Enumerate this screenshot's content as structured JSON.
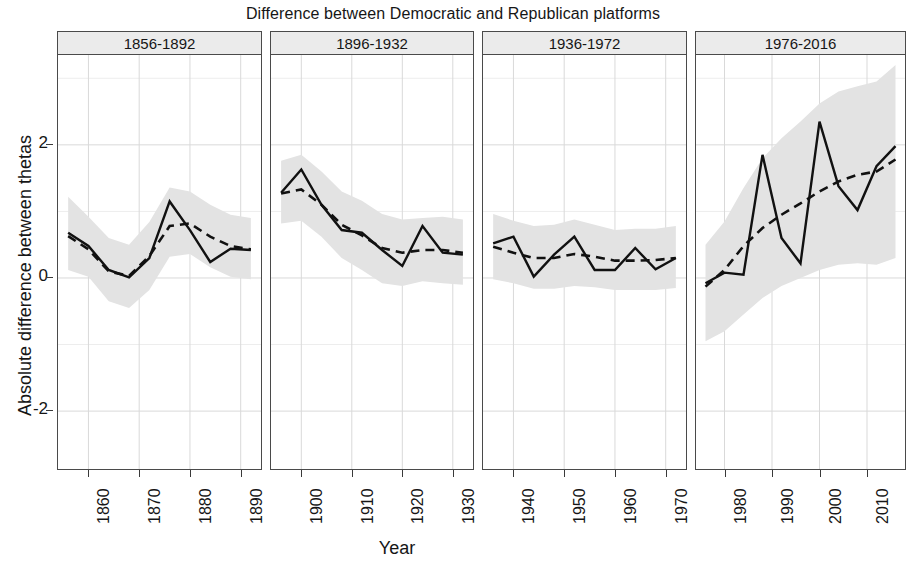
{
  "chart_data": {
    "type": "line",
    "title": "Difference between Democratic and Republican platforms",
    "xlabel": "Year",
    "ylabel": "Absolute difference between thetas",
    "ylim": [
      -2.9,
      3.35
    ],
    "yticks": [
      -2,
      0,
      2
    ],
    "ytick_labels": [
      "-2",
      "0",
      "2"
    ],
    "grid": true,
    "legend": "none",
    "facet_layout": "1x4 horizontal panels, shared y-axis, free x-axis",
    "series_names": [
      "Observed absolute difference",
      "Smoothed trend",
      "95% credible interval"
    ],
    "panels": [
      {
        "label": "1856-1892",
        "xlim": [
          1854,
          1894
        ],
        "xticks": [
          1860,
          1870,
          1880,
          1890
        ],
        "xtick_labels": [
          "1860",
          "1870",
          "1880",
          "1890"
        ],
        "x": [
          1856,
          1860,
          1864,
          1868,
          1872,
          1876,
          1880,
          1884,
          1888,
          1892
        ],
        "observed": [
          0.68,
          0.48,
          0.12,
          0.01,
          0.3,
          1.15,
          0.72,
          0.24,
          0.44,
          0.42
        ],
        "smooth": [
          0.63,
          0.43,
          0.1,
          0.03,
          0.33,
          0.78,
          0.82,
          0.62,
          0.48,
          0.43
        ],
        "ci_low": [
          0.12,
          0.02,
          -0.35,
          -0.45,
          -0.18,
          0.32,
          0.36,
          0.16,
          0.02,
          -0.02
        ],
        "ci_high": [
          1.22,
          0.92,
          0.6,
          0.5,
          0.84,
          1.36,
          1.3,
          1.1,
          0.95,
          0.9
        ]
      },
      {
        "label": "1896-1932",
        "xlim": [
          1894,
          1934
        ],
        "xticks": [
          1900,
          1910,
          1920,
          1930
        ],
        "xtick_labels": [
          "1900",
          "1910",
          "1920",
          "1930"
        ],
        "x": [
          1896,
          1900,
          1904,
          1908,
          1912,
          1916,
          1920,
          1924,
          1928,
          1932
        ],
        "observed": [
          1.28,
          1.63,
          1.1,
          0.72,
          0.68,
          0.42,
          0.18,
          0.78,
          0.38,
          0.35
        ],
        "smooth": [
          1.27,
          1.33,
          1.1,
          0.8,
          0.64,
          0.45,
          0.38,
          0.42,
          0.42,
          0.38
        ],
        "ci_low": [
          0.82,
          0.86,
          0.62,
          0.3,
          0.12,
          -0.08,
          -0.12,
          -0.05,
          -0.08,
          -0.1
        ],
        "ci_high": [
          1.76,
          1.85,
          1.6,
          1.3,
          1.16,
          0.96,
          0.88,
          0.9,
          0.92,
          0.88
        ]
      },
      {
        "label": "1936-1972",
        "xlim": [
          1934,
          1974
        ],
        "xticks": [
          1940,
          1950,
          1960,
          1970
        ],
        "xtick_labels": [
          "1940",
          "1950",
          "1960",
          "1970"
        ],
        "x": [
          1936,
          1940,
          1944,
          1948,
          1952,
          1956,
          1960,
          1964,
          1968,
          1972
        ],
        "observed": [
          0.52,
          0.62,
          0.02,
          0.35,
          0.62,
          0.12,
          0.12,
          0.45,
          0.13,
          0.3
        ],
        "smooth": [
          0.47,
          0.38,
          0.3,
          0.3,
          0.36,
          0.32,
          0.26,
          0.26,
          0.27,
          0.3
        ],
        "ci_low": [
          -0.02,
          -0.08,
          -0.16,
          -0.16,
          -0.12,
          -0.14,
          -0.18,
          -0.18,
          -0.18,
          -0.15
        ],
        "ci_high": [
          0.96,
          0.86,
          0.78,
          0.8,
          0.88,
          0.8,
          0.72,
          0.74,
          0.74,
          0.78
        ]
      },
      {
        "label": "1976-2016",
        "xlim": [
          1974,
          2018
        ],
        "xticks": [
          1980,
          1990,
          2000,
          2010
        ],
        "xtick_labels": [
          "1980",
          "1990",
          "2000",
          "2010"
        ],
        "x": [
          1976,
          1980,
          1984,
          1988,
          1992,
          1996,
          2000,
          2004,
          2008,
          2012,
          2016
        ],
        "observed": [
          -0.08,
          0.08,
          0.05,
          1.85,
          0.6,
          0.22,
          2.35,
          1.38,
          1.02,
          1.68,
          1.98
        ],
        "smooth": [
          -0.13,
          0.12,
          0.48,
          0.75,
          0.95,
          1.12,
          1.3,
          1.45,
          1.55,
          1.6,
          1.78
        ],
        "ci_low": [
          -0.95,
          -0.8,
          -0.55,
          -0.3,
          -0.12,
          0.0,
          0.12,
          0.2,
          0.22,
          0.2,
          0.3
        ],
        "ci_high": [
          0.5,
          0.85,
          1.35,
          1.8,
          2.1,
          2.35,
          2.62,
          2.8,
          2.88,
          2.95,
          3.2
        ]
      }
    ]
  },
  "style": {
    "line_color": "#111111",
    "smooth_color": "#111111",
    "ribbon_color": "#e3e3e3",
    "grid_color": "#d9d9d9",
    "panel_strip_bg": "#ebebeb",
    "border_color": "#4a4a4a"
  }
}
